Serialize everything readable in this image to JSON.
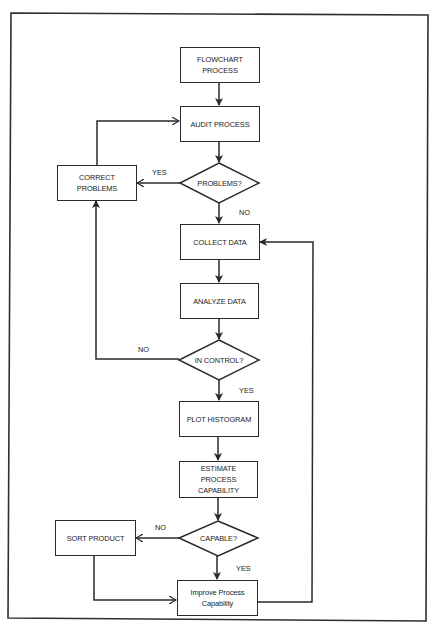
{
  "diagram": {
    "type": "flowchart",
    "nodes": {
      "flowchart_process": "FLOWCHART\nPROCESS",
      "audit_process": "AUDIT PROCESS",
      "problems_decision": "PROBLEMS?",
      "correct_problems": "CORRECT\nPROBLEMS",
      "collect_data": "COLLECT DATA",
      "analyze_data": "ANALYZE DATA",
      "in_control_decision": "IN CONTROL?",
      "plot_histogram": "PLOT HISTOGRAM",
      "estimate_capability": "ESTIMATE\nPROCESS\nCAPABILITY",
      "capable_decision": "CAPABLE?",
      "sort_product": "SORT PRODUCT",
      "improve_capability": "Improve Process\nCapability"
    },
    "edge_labels": {
      "problems_yes": "YES",
      "problems_no": "NO",
      "in_control_no": "NO",
      "in_control_yes": "YES",
      "capable_no": "NO",
      "capable_yes": "YES"
    },
    "edges": [
      {
        "from": "FLOWCHART PROCESS",
        "to": "AUDIT PROCESS"
      },
      {
        "from": "AUDIT PROCESS",
        "to": "PROBLEMS?"
      },
      {
        "from": "PROBLEMS?",
        "to": "CORRECT PROBLEMS",
        "label": "YES"
      },
      {
        "from": "CORRECT PROBLEMS",
        "to": "AUDIT PROCESS"
      },
      {
        "from": "PROBLEMS?",
        "to": "COLLECT DATA",
        "label": "NO"
      },
      {
        "from": "COLLECT DATA",
        "to": "ANALYZE DATA"
      },
      {
        "from": "ANALYZE DATA",
        "to": "IN CONTROL?"
      },
      {
        "from": "IN CONTROL?",
        "to": "CORRECT PROBLEMS",
        "label": "NO"
      },
      {
        "from": "IN CONTROL?",
        "to": "PLOT HISTOGRAM",
        "label": "YES"
      },
      {
        "from": "PLOT HISTOGRAM",
        "to": "ESTIMATE PROCESS CAPABILITY"
      },
      {
        "from": "ESTIMATE PROCESS CAPABILITY",
        "to": "CAPABLE?"
      },
      {
        "from": "CAPABLE?",
        "to": "SORT PRODUCT",
        "label": "NO"
      },
      {
        "from": "CAPABLE?",
        "to": "Improve Process Capability",
        "label": "YES"
      },
      {
        "from": "SORT PRODUCT",
        "to": "Improve Process Capability"
      },
      {
        "from": "Improve Process Capability",
        "to": "COLLECT DATA"
      }
    ]
  }
}
